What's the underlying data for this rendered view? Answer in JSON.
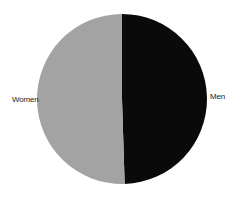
{
  "chart_data": {
    "type": "pie",
    "title": "",
    "categories": [
      "Men",
      "Women"
    ],
    "values": [
      49.5,
      50.5
    ],
    "colors": [
      "#0a0a0a",
      "#a3a3a3"
    ],
    "start_angle_deg": 0,
    "direction": "clockwise",
    "legend": "none",
    "labels_position": "outside"
  },
  "labels": {
    "women": "Women",
    "men": "Men"
  }
}
